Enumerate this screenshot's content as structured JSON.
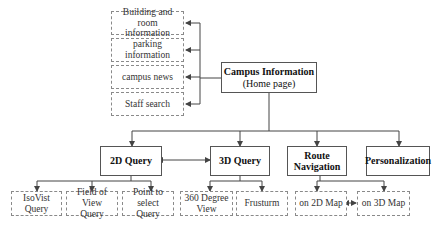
{
  "diagram": {
    "root": {
      "title": "Campus Information",
      "subtitle": "(Home page)"
    },
    "info_items": [
      {
        "line1": "Building and room",
        "line2": "information"
      },
      {
        "line1": "parking information",
        "line2": ""
      },
      {
        "line1": "campus news",
        "line2": ""
      },
      {
        "line1": "Staff search",
        "line2": ""
      }
    ],
    "modules": [
      {
        "line1": "2D Query",
        "line2": ""
      },
      {
        "line1": "3D Query",
        "line2": ""
      },
      {
        "line1": "Route",
        "line2": "Navigation"
      },
      {
        "line1": "Personalization",
        "line2": ""
      }
    ],
    "sub_items": [
      {
        "line1": "IsoVist Query",
        "line2": ""
      },
      {
        "line1": "Field of View",
        "line2": "Query"
      },
      {
        "line1": "Point to select",
        "line2": "Query"
      },
      {
        "line1": "360 Degree",
        "line2": "View"
      },
      {
        "line1": "Frusturm",
        "line2": ""
      },
      {
        "line1": "on 2D Map",
        "line2": ""
      },
      {
        "line1": "on 3D Map",
        "line2": ""
      }
    ],
    "colors": {
      "line": "#444444",
      "dashed_border": "#8a8a8a"
    }
  }
}
